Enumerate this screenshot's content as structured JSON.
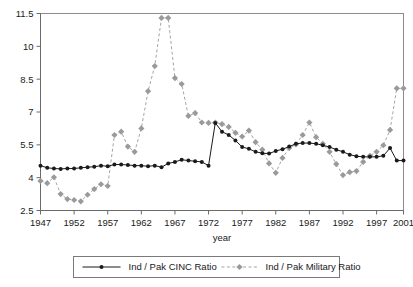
{
  "chart_data": {
    "type": "line",
    "title": "",
    "xlabel": "year",
    "ylabel": "",
    "xlim": [
      1947,
      2001
    ],
    "ylim": [
      2.5,
      11.5
    ],
    "grid": false,
    "legend_position": "bottom",
    "x_ticks": [
      "1947",
      "1952",
      "1957",
      "1962",
      "1967",
      "1972",
      "1977",
      "1982",
      "1987",
      "1992",
      "1997",
      "2001"
    ],
    "x_tick_values": [
      1947,
      1952,
      1957,
      1962,
      1967,
      1972,
      1977,
      1982,
      1987,
      1992,
      1997,
      2001
    ],
    "y_ticks": [
      "2.5",
      "4",
      "5.5",
      "7",
      "8.5",
      "10",
      "11.5"
    ],
    "y_tick_values": [
      2.5,
      4,
      5.5,
      7,
      8.5,
      10,
      11.5
    ],
    "x": [
      1947,
      1948,
      1949,
      1950,
      1951,
      1952,
      1953,
      1954,
      1955,
      1956,
      1957,
      1958,
      1959,
      1960,
      1961,
      1962,
      1963,
      1964,
      1965,
      1966,
      1967,
      1968,
      1969,
      1970,
      1971,
      1972,
      1973,
      1974,
      1975,
      1976,
      1977,
      1978,
      1979,
      1980,
      1981,
      1982,
      1983,
      1984,
      1985,
      1986,
      1987,
      1988,
      1989,
      1990,
      1991,
      1992,
      1993,
      1994,
      1995,
      1996,
      1997,
      1998,
      1999,
      2000,
      2001
    ],
    "series": [
      {
        "name": "Ind / Pak CINC Ratio",
        "color": "#1a1a1a",
        "marker": "circle",
        "dash": "solid",
        "values": [
          4.55,
          4.45,
          4.42,
          4.4,
          4.42,
          4.42,
          4.45,
          4.48,
          4.5,
          4.55,
          4.52,
          4.6,
          4.6,
          4.58,
          4.55,
          4.55,
          4.52,
          4.55,
          4.48,
          4.65,
          4.72,
          4.82,
          4.78,
          4.75,
          4.72,
          4.55,
          6.5,
          6.1,
          5.95,
          5.7,
          5.4,
          5.32,
          5.18,
          5.12,
          5.1,
          5.22,
          5.3,
          5.42,
          5.55,
          5.58,
          5.58,
          5.55,
          5.48,
          5.4,
          5.28,
          5.18,
          5.05,
          4.98,
          4.95,
          4.95,
          4.95,
          5.0,
          5.35,
          4.78,
          4.78
        ]
      },
      {
        "name": "Ind / Pak Military Ratio",
        "color": "#9a9a9a",
        "marker": "diamond",
        "dash": "dashed",
        "values": [
          3.85,
          3.75,
          4.02,
          3.25,
          3.02,
          2.98,
          2.92,
          3.22,
          3.48,
          3.7,
          3.62,
          5.95,
          6.1,
          5.42,
          5.18,
          6.25,
          7.95,
          9.1,
          11.3,
          11.3,
          8.55,
          8.28,
          6.82,
          6.95,
          6.52,
          6.5,
          6.52,
          6.45,
          6.32,
          6.05,
          5.88,
          6.15,
          5.62,
          5.28,
          4.65,
          4.22,
          4.9,
          5.35,
          5.52,
          5.95,
          6.52,
          5.85,
          5.55,
          5.18,
          4.62,
          4.12,
          4.25,
          4.3,
          4.72,
          5.0,
          5.18,
          5.48,
          6.18,
          8.08,
          8.08
        ]
      }
    ]
  },
  "legend": {
    "entries": [
      {
        "label": "Ind / Pak CINC Ratio"
      },
      {
        "label": "Ind / Pak Military Ratio"
      }
    ]
  },
  "axes": {
    "x_title": "year"
  }
}
